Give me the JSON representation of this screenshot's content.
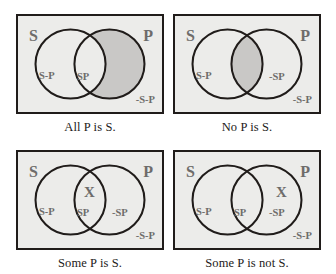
{
  "figure": {
    "colors": {
      "box_border": "#201c1a",
      "box_fill": "#ececea",
      "shade_fill": "#c9c8c6",
      "circle_stroke": "#201c1a",
      "label_text": "#6e6c6b",
      "caption_text": "#1d1a19"
    },
    "panels": [
      {
        "id": "all-p-is-s",
        "caption": "All P is S.",
        "subject_label": "S",
        "predicate_label": "P",
        "region_s_only": "S-P",
        "region_overlap": "SP",
        "region_p_only": "",
        "region_outside": "-S-P",
        "x_mark": "",
        "x_position": "none",
        "shaded_region": "p-only"
      },
      {
        "id": "no-p-is-s",
        "caption": "No P is S.",
        "subject_label": "S",
        "predicate_label": "P",
        "region_s_only": "S-P",
        "region_overlap": "",
        "region_p_only": "-SP",
        "region_outside": "-S-P",
        "x_mark": "",
        "x_position": "none",
        "shaded_region": "overlap"
      },
      {
        "id": "some-p-is-s",
        "caption": "Some P is S.",
        "subject_label": "S",
        "predicate_label": "P",
        "region_s_only": "S-P",
        "region_overlap": "SP",
        "region_p_only": "-SP",
        "region_outside": "-S-P",
        "x_mark": "X",
        "x_position": "overlap",
        "shaded_region": "none"
      },
      {
        "id": "some-p-is-not-s",
        "caption": "Some P is not S.",
        "subject_label": "S",
        "predicate_label": "P",
        "region_s_only": "S-P",
        "region_overlap": "SP",
        "region_p_only": "-SP",
        "region_outside": "-S-P",
        "x_mark": "X",
        "x_position": "p-only",
        "shaded_region": "none"
      }
    ]
  }
}
